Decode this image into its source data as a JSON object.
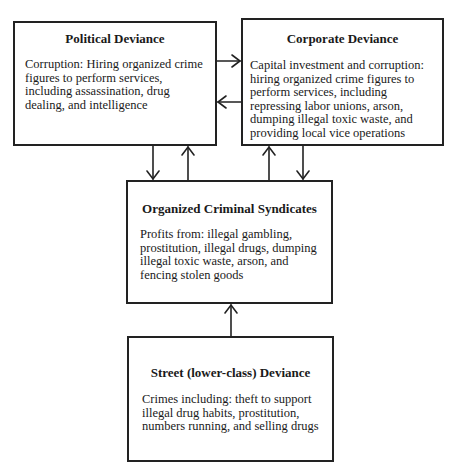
{
  "diagram": {
    "nodes": {
      "political": {
        "title": "Political Deviance",
        "body": "Corruption: Hiring organized crime figures to perform services, including assassination, drug dealing, and intelligence"
      },
      "corporate": {
        "title": "Corporate Deviance",
        "body": "Capital investment and corruption: hiring organized crime figures to perform services, including repressing labor unions, arson, dumping illegal toxic waste, and providing local vice operations"
      },
      "organized": {
        "title": "Organized Criminal Syndicates",
        "body": "Profits from: illegal gambling, prostitution, illegal drugs, dumping illegal toxic waste, arson, and fencing stolen goods"
      },
      "street": {
        "title": "Street (lower-class) Deviance",
        "body": "Crimes including: theft to support illegal drug habits, prostitution, numbers running, and selling drugs"
      }
    },
    "edges": [
      {
        "from": "political",
        "to": "corporate"
      },
      {
        "from": "corporate",
        "to": "political"
      },
      {
        "from": "political",
        "to": "organized"
      },
      {
        "from": "organized",
        "to": "political"
      },
      {
        "from": "organized",
        "to": "corporate"
      },
      {
        "from": "corporate",
        "to": "organized"
      },
      {
        "from": "street",
        "to": "organized"
      }
    ],
    "colors": {
      "line": "#222222",
      "background": "#ffffff"
    }
  }
}
